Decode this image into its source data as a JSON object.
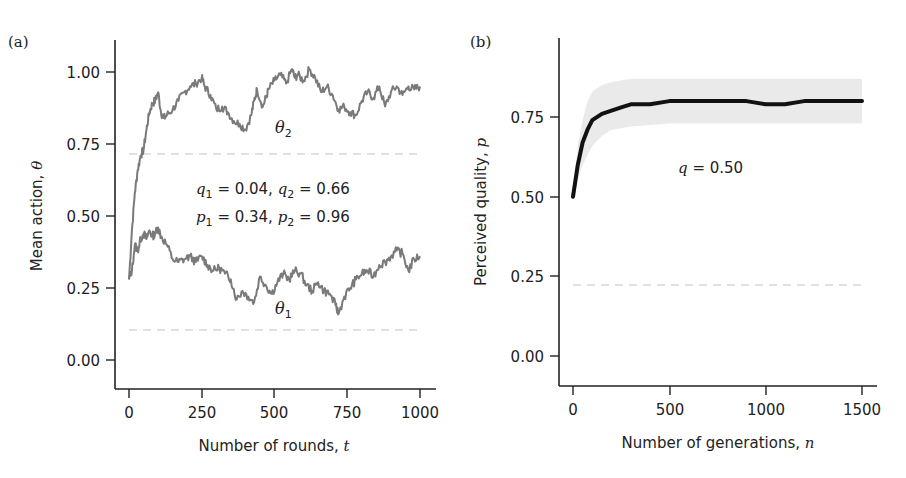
{
  "chart_data": [
    {
      "panel": "(a)",
      "type": "line",
      "title": "",
      "xlabel": "Number of rounds, t",
      "ylabel": "Mean action, θ",
      "xlim": [
        0,
        1000
      ],
      "ylim": [
        -0.1,
        1.1
      ],
      "xticks": [
        0,
        250,
        500,
        750,
        1000
      ],
      "xtick_labels": [
        "0",
        "250",
        "500",
        "750",
        "1000"
      ],
      "yticks": [
        0.0,
        0.25,
        0.5,
        0.75,
        1.0
      ],
      "ytick_labels": [
        "0.00",
        "0.25",
        "0.50",
        "0.75",
        "1.00"
      ],
      "grid": false,
      "legend": "none (inline labels)",
      "series": [
        {
          "name": "θ2",
          "color": "#7a7a7a",
          "x": [
            0,
            10,
            20,
            30,
            40,
            50,
            60,
            70,
            80,
            90,
            100,
            110,
            120,
            130,
            150,
            170,
            190,
            210,
            230,
            250,
            260,
            280,
            300,
            320,
            340,
            360,
            380,
            400,
            420,
            430,
            440,
            460,
            470,
            480,
            500,
            520,
            540,
            560,
            570,
            580,
            600,
            620,
            640,
            660,
            680,
            700,
            720,
            740,
            760,
            780,
            800,
            820,
            840,
            860,
            880,
            900,
            920,
            940,
            960,
            980,
            1000
          ],
          "values": [
            0.28,
            0.45,
            0.58,
            0.66,
            0.71,
            0.73,
            0.8,
            0.86,
            0.89,
            0.9,
            0.93,
            0.86,
            0.84,
            0.85,
            0.87,
            0.9,
            0.93,
            0.95,
            0.96,
            0.98,
            0.95,
            0.92,
            0.87,
            0.88,
            0.86,
            0.83,
            0.82,
            0.8,
            0.85,
            0.9,
            0.94,
            0.88,
            0.91,
            0.94,
            0.97,
            0.99,
            0.96,
            1.01,
            0.98,
            0.99,
            0.97,
            1.01,
            0.98,
            0.93,
            0.95,
            0.92,
            0.87,
            0.88,
            0.86,
            0.85,
            0.9,
            0.93,
            0.91,
            0.95,
            0.88,
            0.93,
            0.95,
            0.92,
            0.95,
            0.94,
            0.95
          ]
        },
        {
          "name": "θ1",
          "color": "#7a7a7a",
          "x": [
            0,
            10,
            20,
            30,
            40,
            50,
            60,
            70,
            80,
            90,
            100,
            110,
            130,
            150,
            170,
            190,
            210,
            230,
            250,
            270,
            290,
            310,
            330,
            350,
            370,
            390,
            410,
            430,
            450,
            470,
            490,
            510,
            530,
            550,
            570,
            590,
            610,
            630,
            650,
            670,
            690,
            710,
            720,
            740,
            760,
            780,
            800,
            820,
            840,
            860,
            880,
            900,
            920,
            940,
            960,
            980,
            1000
          ],
          "values": [
            0.28,
            0.31,
            0.4,
            0.38,
            0.42,
            0.44,
            0.42,
            0.45,
            0.43,
            0.44,
            0.46,
            0.43,
            0.4,
            0.35,
            0.34,
            0.35,
            0.36,
            0.34,
            0.36,
            0.33,
            0.31,
            0.32,
            0.3,
            0.28,
            0.21,
            0.24,
            0.22,
            0.2,
            0.29,
            0.26,
            0.23,
            0.27,
            0.3,
            0.28,
            0.31,
            0.3,
            0.26,
            0.24,
            0.27,
            0.24,
            0.23,
            0.19,
            0.16,
            0.22,
            0.25,
            0.28,
            0.3,
            0.31,
            0.29,
            0.33,
            0.34,
            0.36,
            0.38,
            0.37,
            0.31,
            0.35,
            0.36
          ]
        },
        {
          "name": "threshold-upper (dashed)",
          "color": "#c8c8c8",
          "constant": 0.72
        },
        {
          "name": "threshold-lower (dashed)",
          "color": "#c8c8c8",
          "constant": 0.11
        }
      ],
      "annotations": [
        {
          "text": "θ2",
          "x": 480,
          "y": 0.81
        },
        {
          "text": "θ1",
          "x": 480,
          "y": 0.18
        },
        {
          "text": "q1 = 0.04, q2 = 0.66",
          "x": 480,
          "y": 0.62
        },
        {
          "text": "p1 = 0.34, p2 = 0.96",
          "x": 480,
          "y": 0.52
        }
      ]
    },
    {
      "panel": "(b)",
      "type": "line",
      "title": "",
      "xlabel": "Number of generations, n",
      "ylabel": "Perceived quality, p",
      "xlim": [
        0,
        1500
      ],
      "ylim": [
        -0.1,
        0.95
      ],
      "xticks": [
        0,
        500,
        1000,
        1500
      ],
      "xtick_labels": [
        "0",
        "500",
        "1000",
        "1500"
      ],
      "yticks": [
        0.0,
        0.25,
        0.5,
        0.75
      ],
      "ytick_labels": [
        "0.00",
        "0.25",
        "0.50",
        "0.75"
      ],
      "grid": false,
      "legend": "none",
      "series": [
        {
          "name": "mean p",
          "color": "#111111",
          "x": [
            0,
            25,
            50,
            75,
            100,
            150,
            200,
            250,
            300,
            400,
            500,
            600,
            700,
            800,
            900,
            1000,
            1100,
            1200,
            1300,
            1400,
            1500
          ],
          "values": [
            0.5,
            0.6,
            0.67,
            0.71,
            0.74,
            0.76,
            0.77,
            0.78,
            0.79,
            0.79,
            0.8,
            0.8,
            0.8,
            0.8,
            0.8,
            0.79,
            0.79,
            0.8,
            0.8,
            0.8,
            0.8
          ]
        },
        {
          "name": "spread band (shaded)",
          "color": "#e6e6e6",
          "x": [
            0,
            25,
            50,
            75,
            100,
            150,
            200,
            300,
            500,
            1000,
            1500
          ],
          "upper": [
            0.5,
            0.66,
            0.74,
            0.8,
            0.83,
            0.85,
            0.86,
            0.87,
            0.87,
            0.87,
            0.87
          ],
          "lower": [
            0.5,
            0.55,
            0.6,
            0.63,
            0.66,
            0.69,
            0.71,
            0.72,
            0.73,
            0.73,
            0.73
          ]
        },
        {
          "name": "reference (dashed)",
          "color": "#c8c8c8",
          "constant": 0.22
        }
      ],
      "annotations": [
        {
          "text": "q = 0.50",
          "x": 700,
          "y": 0.62
        }
      ]
    }
  ],
  "panels": {
    "a": {
      "label": "(a)",
      "xlabel_prefix": "Number of rounds, ",
      "xlabel_var": "t",
      "ylabel_prefix": "Mean action, ",
      "ylabel_var": "θ",
      "theta2_sym": "θ",
      "theta2_sub": "2",
      "theta1_sym": "θ",
      "theta1_sub": "1",
      "annot_line1": {
        "q1": "q",
        "s1": "1",
        "v1": " = 0.04, ",
        "q2": "q",
        "s2": "2",
        "v2": " = 0.66"
      },
      "annot_line2": {
        "p1": "p",
        "s1": "1",
        "v1": " = 0.34, ",
        "p2": "p",
        "s2": "2",
        "v2": " = 0.96"
      },
      "yticks": [
        "1.00",
        "0.75",
        "0.50",
        "0.25",
        "0.00"
      ],
      "xticks": [
        "0",
        "250",
        "500",
        "750",
        "1000"
      ]
    },
    "b": {
      "label": "(b)",
      "xlabel_prefix": "Number of generations, ",
      "xlabel_var": "n",
      "ylabel_prefix": "Perceived quality, ",
      "ylabel_var": "p",
      "annot_var": "q",
      "annot_val": " = 0.50",
      "yticks": [
        "0.75",
        "0.50",
        "0.25",
        "0.00"
      ],
      "xticks": [
        "0",
        "500",
        "1000",
        "1500"
      ]
    }
  }
}
